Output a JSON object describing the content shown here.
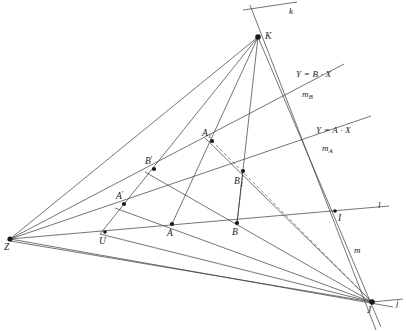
{
  "figure": {
    "background_color": "#ffffff",
    "line_color": "#3a3a3a",
    "point_color": "#1a1a1a",
    "width": 406,
    "height": 331
  },
  "points": [
    {
      "id": "Z",
      "label": "Z",
      "x": 10,
      "y": 239,
      "label_x": 4,
      "label_y": 243,
      "marker": 2.6
    },
    {
      "id": "K",
      "label": "K",
      "x": 258,
      "y": 37,
      "label_x": 265,
      "label_y": 32,
      "marker": 2.8
    },
    {
      "id": "J",
      "label": "J",
      "x": 372,
      "y": 302,
      "label_x": 367,
      "label_y": 306,
      "marker": 2.8
    },
    {
      "id": "U",
      "label": "U",
      "x": 105,
      "y": 232,
      "label_x": 99,
      "label_y": 237,
      "marker": 1.8
    },
    {
      "id": "A",
      "label": "A",
      "x": 172,
      "y": 224,
      "label_x": 167,
      "label_y": 229,
      "marker": 2.1
    },
    {
      "id": "B",
      "label": "B",
      "x": 237,
      "y": 223,
      "label_x": 232,
      "label_y": 228,
      "marker": 2.1
    },
    {
      "id": "Ap",
      "label": "A'",
      "x": 124,
      "y": 204,
      "label_x": 116,
      "label_y": 192,
      "marker": 2.1
    },
    {
      "id": "Bp",
      "label": "B'",
      "x": 154,
      "y": 169,
      "label_x": 145,
      "label_y": 157,
      "marker": 2.1
    },
    {
      "id": "A1",
      "label": "A1",
      "x": 212,
      "y": 141,
      "label_x": 202,
      "label_y": 129,
      "marker": 2.1
    },
    {
      "id": "B1",
      "label": "B1",
      "x": 243,
      "y": 171,
      "label_x": 234,
      "label_y": 177,
      "marker": 2.1
    },
    {
      "id": "I",
      "label": "I",
      "x": 335,
      "y": 211,
      "label_x": 338,
      "label_y": 214,
      "marker": 1.8
    }
  ],
  "line_labels": [
    {
      "id": "k",
      "label": "k",
      "x": 289,
      "y": 7
    },
    {
      "id": "l",
      "label": "l",
      "x": 378,
      "y": 201
    },
    {
      "id": "m",
      "label": "m",
      "x": 354,
      "y": 246
    },
    {
      "id": "j",
      "label": "j",
      "x": 396,
      "y": 299
    },
    {
      "id": "mA",
      "label": "mA",
      "x": 322,
      "y": 144
    },
    {
      "id": "mB",
      "label": "mB",
      "x": 302,
      "y": 90
    }
  ],
  "equations": [
    {
      "id": "eq-b",
      "text": "Y = B · X",
      "x": 296,
      "y": 70
    },
    {
      "id": "eq-a",
      "text": "Y = A · X",
      "x": 316,
      "y": 126
    }
  ],
  "segments": [
    {
      "id": "line-l",
      "name": "line-l",
      "x1": 10,
      "y1": 239,
      "x2": 389,
      "y2": 206,
      "style": "solid"
    },
    {
      "id": "line-mA",
      "name": "line-mA",
      "x1": 10,
      "y1": 239,
      "x2": 371,
      "y2": 116,
      "style": "solid"
    },
    {
      "id": "line-mB",
      "name": "line-mB",
      "x1": 10,
      "y1": 239,
      "x2": 344,
      "y2": 64,
      "style": "solid"
    },
    {
      "id": "line-ZK",
      "name": "line-Z-to-K",
      "x1": 10,
      "y1": 239,
      "x2": 258,
      "y2": 37,
      "style": "solid"
    },
    {
      "id": "line-ZJ",
      "name": "line-Z-to-J",
      "x1": 10,
      "y1": 239,
      "x2": 393,
      "y2": 307,
      "style": "solid"
    },
    {
      "id": "line-ZJ2",
      "name": "line-Z-to-J-low",
      "x1": 10,
      "y1": 241,
      "x2": 372,
      "y2": 302,
      "style": "solid"
    },
    {
      "id": "line-k",
      "name": "line-k",
      "x1": 243,
      "y1": 10,
      "x2": 297,
      "y2": 2,
      "style": "solid"
    },
    {
      "id": "line-m",
      "name": "line-m",
      "x1": 258,
      "y1": 37,
      "x2": 381,
      "y2": 327,
      "style": "solid"
    },
    {
      "id": "line-j",
      "name": "line-j-through-J",
      "x1": 250,
      "y1": 5,
      "x2": 376,
      "y2": 330,
      "style": "solid"
    },
    {
      "id": "line-jr",
      "name": "line-j-right",
      "x1": 372,
      "y1": 302,
      "x2": 403,
      "y2": 299,
      "style": "solid"
    },
    {
      "id": "line-KU",
      "name": "line-K-to-U",
      "x1": 258,
      "y1": 37,
      "x2": 100,
      "y2": 234,
      "style": "solid"
    },
    {
      "id": "line-KA",
      "name": "line-K-to-A",
      "x1": 258,
      "y1": 37,
      "x2": 172,
      "y2": 224,
      "style": "solid"
    },
    {
      "id": "line-KB",
      "name": "line-K-to-B",
      "x1": 258,
      "y1": 37,
      "x2": 237,
      "y2": 223,
      "style": "solid"
    },
    {
      "id": "line-JAp",
      "name": "line-J-to-Aprime",
      "x1": 372,
      "y1": 302,
      "x2": 115,
      "y2": 208,
      "style": "solid"
    },
    {
      "id": "line-JBp",
      "name": "line-J-to-Bprime",
      "x1": 372,
      "y1": 302,
      "x2": 145,
      "y2": 172,
      "style": "solid"
    },
    {
      "id": "line-JA1",
      "name": "line-J-to-A1",
      "x1": 372,
      "y1": 302,
      "x2": 205,
      "y2": 138,
      "style": "solid"
    },
    {
      "id": "line-JU",
      "name": "line-J-to-U",
      "x1": 372,
      "y1": 302,
      "x2": 100,
      "y2": 234,
      "style": "solid"
    },
    {
      "id": "seg-B1B",
      "name": "segment-B1-to-B",
      "x1": 243,
      "y1": 171,
      "x2": 237,
      "y2": 223,
      "style": "solid"
    },
    {
      "id": "dash-A1J",
      "name": "dashed-A1-to-J",
      "x1": 212,
      "y1": 141,
      "x2": 374,
      "y2": 304,
      "style": "dashed"
    }
  ]
}
